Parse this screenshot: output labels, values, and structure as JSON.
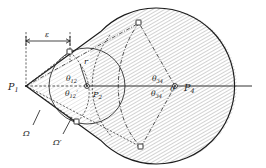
{
  "figure": {
    "background_color": "#ffffff",
    "ink_color": "#1c1c1c",
    "width": 266,
    "height": 168
  },
  "labels": {
    "p1": {
      "base": "P",
      "sub": "1",
      "x": 12,
      "y": 88
    },
    "p2": {
      "base": "P",
      "sub": "2",
      "x": 94,
      "y": 95
    },
    "p4": {
      "base": "P",
      "sub": "4",
      "x": 185,
      "y": 90
    },
    "origin": {
      "text": "0",
      "x": 174,
      "y": 90
    },
    "radius_r": {
      "text": "r",
      "x": 86,
      "y": 66
    },
    "epsilon": {
      "text": "ε",
      "x": 48,
      "y": 40
    },
    "omega": {
      "text": "Ω",
      "x": 27,
      "y": 133
    },
    "omega_prime": {
      "text": "Ω′",
      "x": 57,
      "y": 142
    },
    "theta_12": {
      "base": "θ",
      "sub": "12",
      "x": 71,
      "y": 80
    },
    "theta_12_prime": {
      "base": "θ",
      "sub": "12",
      "prime": "′",
      "x": 70,
      "y": 95
    },
    "theta_34": {
      "base": "θ",
      "sub": "34",
      "x": 157,
      "y": 80
    },
    "theta_34_prime": {
      "base": "θ",
      "sub": "34",
      "prime": "′",
      "x": 156,
      "y": 95
    }
  },
  "geometry": {
    "apex": {
      "x": 26,
      "y": 86
    },
    "inner_center": {
      "x": 87,
      "y": 86
    },
    "inner_radius": 38,
    "outer_center": {
      "x": 175,
      "y": 86
    },
    "outer_radius": 78,
    "axis": {
      "x1": 26,
      "y1": 86,
      "x2": 252,
      "y2": 86
    },
    "epsilon_extent": {
      "x_start": 26,
      "x_end": 70,
      "y": 38
    }
  },
  "markers": {
    "boundary_squares": [
      {
        "name": "marker-upper-left",
        "x": 70,
        "y": 52
      },
      {
        "name": "marker-upper-right",
        "x": 139,
        "y": 23
      },
      {
        "name": "marker-lower-left",
        "x": 77,
        "y": 122
      },
      {
        "name": "marker-lower-right",
        "x": 141,
        "y": 147
      }
    ]
  },
  "hatching": {
    "pattern": "diagonal-lines",
    "angle_deg": 60,
    "spacing_px": 3.0,
    "stroke_color": "#5a5a5a",
    "stroke_width": 0.55,
    "light_stroke_color": "#9a9a9a"
  }
}
